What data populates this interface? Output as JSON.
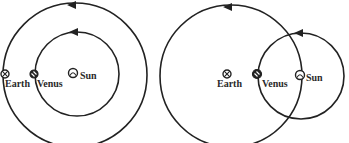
{
  "diagram": {
    "panels": [
      {
        "id": "heliocentric",
        "orbits": [
          {
            "name": "earth-orbit",
            "cx": 75,
            "cy": 75,
            "r": 72,
            "arrow_x": 72,
            "arrow_y": 3
          },
          {
            "name": "venus-orbit",
            "cx": 77,
            "cy": 74,
            "r": 42,
            "arrow_x": 74,
            "arrow_y": 32
          }
        ],
        "bodies": [
          {
            "name": "Earth",
            "label": "Earth",
            "x": 5,
            "y": 74
          },
          {
            "name": "Venus",
            "label": "Venus",
            "x": 34,
            "y": 74
          },
          {
            "name": "Sun",
            "label": "Sun",
            "x": 73,
            "y": 73
          }
        ]
      },
      {
        "id": "geocentric",
        "orbits": [
          {
            "name": "sun-orbit",
            "cx": 231,
            "cy": 76,
            "r": 71,
            "arrow_x": 228,
            "arrow_y": 5
          },
          {
            "name": "venus-epicycle",
            "cx": 301,
            "cy": 76,
            "r": 43,
            "arrow_x": 299,
            "arrow_y": 33
          }
        ],
        "bodies": [
          {
            "name": "Earth",
            "label": "Earth",
            "x": 227,
            "y": 74
          },
          {
            "name": "Venus",
            "label": "Venus",
            "x": 257,
            "y": 74
          },
          {
            "name": "Sun",
            "label": "Sun",
            "x": 300,
            "y": 75
          }
        ]
      }
    ],
    "labels": {
      "left_earth": "Earth",
      "left_venus": "Venus",
      "left_sun": "Sun",
      "right_earth": "Earth",
      "right_venus": "Venus",
      "right_sun": "Sun"
    }
  }
}
